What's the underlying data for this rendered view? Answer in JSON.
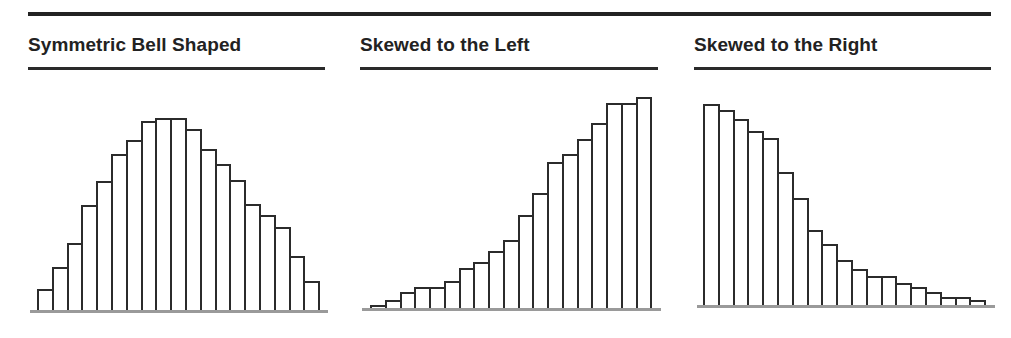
{
  "chart_data": [
    {
      "type": "bar",
      "title": "Symmetric Bell Shaped",
      "xlabel": "",
      "ylabel": "",
      "grid": false,
      "categories": [
        1,
        2,
        3,
        4,
        5,
        6,
        7,
        8,
        9,
        10,
        11,
        12,
        13,
        14,
        15,
        16,
        17,
        18,
        19
      ],
      "values": [
        22,
        44,
        68,
        106,
        130,
        157,
        171,
        190,
        193,
        193,
        182,
        162,
        147,
        131,
        107,
        96,
        84,
        55,
        30
      ]
    },
    {
      "type": "bar",
      "title": "Skewed to the Left",
      "xlabel": "",
      "ylabel": "",
      "grid": false,
      "categories": [
        1,
        2,
        3,
        4,
        5,
        6,
        7,
        8,
        9,
        10,
        11,
        12,
        13,
        14,
        15,
        16,
        17,
        18,
        19
      ],
      "values": [
        4,
        9,
        17,
        22,
        22,
        28,
        41,
        47,
        58,
        69,
        94,
        116,
        147,
        155,
        170,
        186,
        206,
        206,
        212
      ]
    },
    {
      "type": "bar",
      "title": "Skewed to the Right",
      "xlabel": "",
      "ylabel": "",
      "grid": false,
      "categories": [
        1,
        2,
        3,
        4,
        5,
        6,
        7,
        8,
        9,
        10,
        11,
        12,
        13,
        14,
        15,
        16,
        17,
        18,
        19
      ],
      "values": [
        203,
        197,
        188,
        176,
        169,
        135,
        109,
        77,
        63,
        47,
        38,
        31,
        31,
        24,
        20,
        15,
        10,
        10,
        7
      ]
    }
  ],
  "panels": [
    {
      "title": "Symmetric Bell Shaped"
    },
    {
      "title": "Skewed to the Left"
    },
    {
      "title": "Skewed to the Right"
    }
  ]
}
